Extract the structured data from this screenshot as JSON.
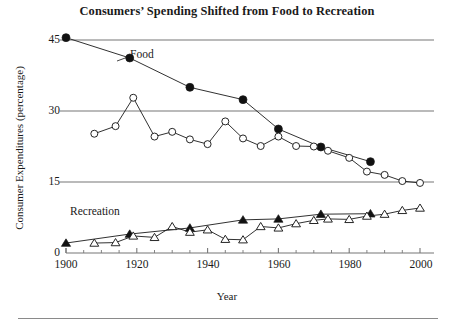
{
  "figure": {
    "title": "Consumers’ Spending Shifted from Food to Recreation",
    "bottom_rule": true
  },
  "axes": {
    "y_title": "Consumer Expenditures (percentage)",
    "x_title": "Year",
    "y_ticks": [
      "0",
      "15",
      "30",
      "45"
    ],
    "x_ticks": [
      "1900",
      "1920",
      "1940",
      "1960",
      "1980",
      "2000"
    ]
  },
  "annotations": {
    "food_label": "Food",
    "recreation_label": "Recreation"
  },
  "colors": {
    "line": "#1a1a1a",
    "gridline": "#777777",
    "marker_fill_solid": "#111111",
    "marker_fill_open": "#ffffff",
    "text": "#1a1a1a"
  },
  "chart_data": {
    "type": "line",
    "title": "Consumers’ Spending Shifted from Food to Recreation",
    "xlabel": "Year",
    "ylabel": "Consumer Expenditures (percentage)",
    "xlim": [
      1900,
      2000
    ],
    "ylim": [
      0,
      47
    ],
    "yticks": [
      0,
      15,
      30,
      45
    ],
    "xticks": [
      1900,
      1920,
      1940,
      1960,
      1980,
      2000
    ],
    "grid": "horizontal",
    "legend": "inline-annotations",
    "series": [
      {
        "name": "Food (benchmark decades)",
        "marker": "filled-circle",
        "x": [
          1900,
          1918,
          1935,
          1950,
          1960,
          1972,
          1986
        ],
        "values": [
          45.5,
          41.2,
          35.0,
          32.4,
          26.2,
          22.4,
          19.3
        ]
      },
      {
        "name": "Food (annual series)",
        "marker": "open-circle",
        "x": [
          1908,
          1914,
          1919,
          1925,
          1930,
          1935,
          1940,
          1945,
          1950,
          1955,
          1960,
          1965,
          1970,
          1974,
          1980,
          1985,
          1990,
          1995,
          2000
        ],
        "values": [
          25.2,
          26.8,
          32.8,
          24.6,
          25.6,
          24.0,
          23.0,
          27.8,
          24.2,
          22.6,
          24.6,
          22.6,
          22.5,
          21.6,
          20.1,
          17.2,
          16.5,
          15.2,
          14.8
        ]
      },
      {
        "name": "Recreation (benchmark decades)",
        "marker": "filled-triangle",
        "x": [
          1900,
          1918,
          1935,
          1950,
          1960,
          1972,
          1986
        ],
        "values": [
          2.1,
          4.0,
          5.3,
          7.0,
          7.2,
          8.2,
          8.3
        ]
      },
      {
        "name": "Recreation (annual series)",
        "marker": "open-triangle",
        "x": [
          1908,
          1914,
          1919,
          1925,
          1930,
          1935,
          1940,
          1945,
          1950,
          1955,
          1960,
          1965,
          1970,
          1974,
          1980,
          1985,
          1990,
          1995,
          2000
        ],
        "values": [
          2.1,
          2.2,
          3.6,
          3.3,
          5.6,
          4.4,
          4.9,
          2.9,
          2.8,
          5.6,
          5.3,
          6.2,
          6.9,
          7.2,
          7.1,
          7.8,
          8.2,
          9.0,
          9.5
        ]
      }
    ]
  }
}
